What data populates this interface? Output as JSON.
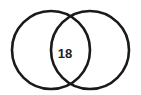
{
  "diagram": {
    "type": "venn",
    "sets": [
      {
        "name": "left-set",
        "cx": 51,
        "cy": 50,
        "r": 39
      },
      {
        "name": "right-set",
        "cx": 90,
        "cy": 50,
        "r": 39
      }
    ],
    "intersection_label": "18",
    "stroke_color": "#1a1a1a",
    "background": "#ffffff"
  }
}
